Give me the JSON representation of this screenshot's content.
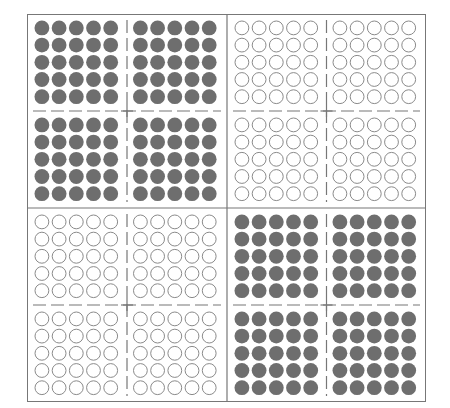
{
  "diagram": {
    "title": "",
    "grid": {
      "rows": 2,
      "cols": 2
    },
    "quadrants": [
      {
        "position": "top-left",
        "fill": "filled",
        "blocks": 4,
        "dots_per_block": 25
      },
      {
        "position": "top-right",
        "fill": "empty",
        "blocks": 4,
        "dots_per_block": 25
      },
      {
        "position": "bottom-left",
        "fill": "empty",
        "blocks": 4,
        "dots_per_block": 25
      },
      {
        "position": "bottom-right",
        "fill": "filled",
        "blocks": 4,
        "dots_per_block": 25
      }
    ],
    "colors": {
      "filled_dot": "#6e6e6e",
      "empty_dot_stroke": "#8a8a8a",
      "frame": "#777777",
      "dashed_line": "#777777"
    }
  }
}
